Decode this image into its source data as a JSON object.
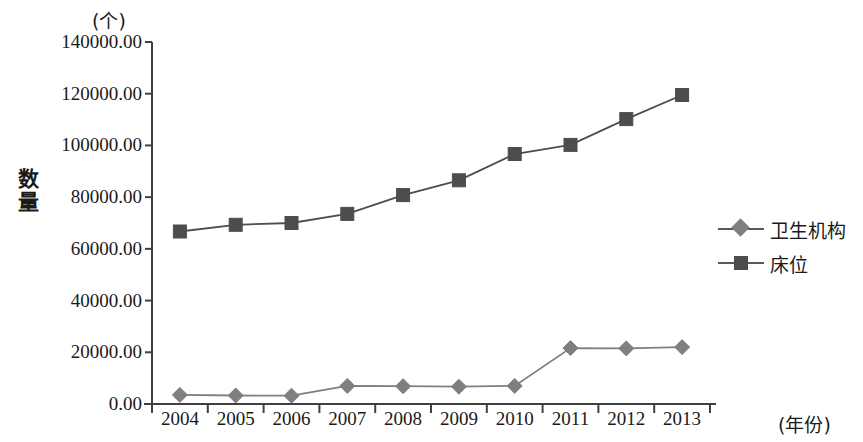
{
  "chart_data": {
    "type": "line",
    "title": "",
    "unit_label": "(个)",
    "ylabel": "数量",
    "xlabel": "(年份)",
    "categories": [
      "2004",
      "2005",
      "2006",
      "2007",
      "2008",
      "2009",
      "2010",
      "2011",
      "2012",
      "2013"
    ],
    "ytick_labels": [
      "0.00",
      "20000.00",
      "40000.00",
      "60000.00",
      "80000.00",
      "100000.00",
      "120000.00",
      "140000.00"
    ],
    "ytick_values": [
      0,
      20000,
      40000,
      60000,
      80000,
      100000,
      120000,
      140000
    ],
    "ylim": [
      0,
      140000
    ],
    "grid": false,
    "legend_position": "right",
    "series": [
      {
        "name": "卫生机构",
        "marker": "diamond",
        "color": "#7f7f7f",
        "values": [
          3500,
          3300,
          3200,
          7000,
          6900,
          6700,
          7000,
          21600,
          21500,
          22000
        ]
      },
      {
        "name": "床位",
        "marker": "square",
        "color": "#4d4d4d",
        "values": [
          66700,
          69300,
          70000,
          73500,
          80800,
          86500,
          96700,
          100200,
          110200,
          119500
        ]
      }
    ]
  },
  "legend": {
    "items": [
      {
        "label": "卫生机构"
      },
      {
        "label": "床位"
      }
    ]
  }
}
